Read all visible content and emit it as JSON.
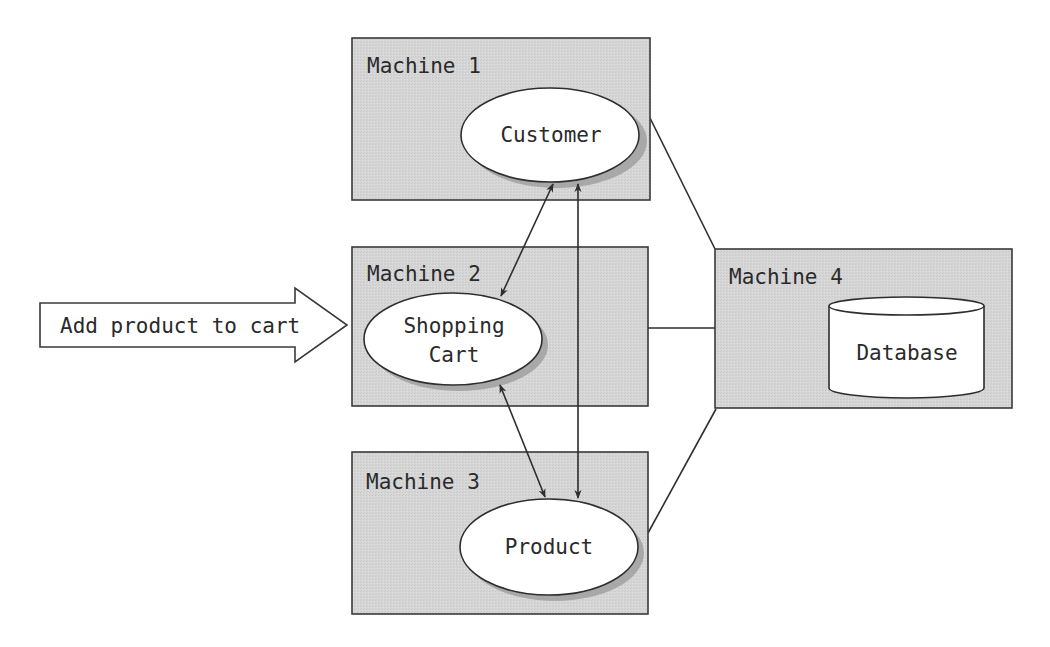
{
  "diagram": {
    "input_arrow": {
      "label": "Add product to cart"
    },
    "machines": [
      {
        "id": "m1",
        "label": "Machine 1",
        "component": {
          "type": "ellipse",
          "lines": [
            "Customer"
          ]
        }
      },
      {
        "id": "m2",
        "label": "Machine 2",
        "component": {
          "type": "ellipse",
          "lines": [
            "Shopping",
            "Cart"
          ]
        }
      },
      {
        "id": "m3",
        "label": "Machine 3",
        "component": {
          "type": "ellipse",
          "lines": [
            "Product"
          ]
        }
      },
      {
        "id": "m4",
        "label": "Machine 4",
        "component": {
          "type": "cylinder",
          "lines": [
            "Database"
          ]
        }
      }
    ],
    "connections": [
      {
        "from": "Shopping Cart",
        "to": "Customer",
        "style": "bidirectional-arrow"
      },
      {
        "from": "Shopping Cart",
        "to": "Product",
        "style": "bidirectional-arrow"
      },
      {
        "from": "Customer",
        "to": "Product",
        "style": "bidirectional-arrow"
      },
      {
        "from": "Machine 1",
        "to": "Machine 4",
        "style": "line"
      },
      {
        "from": "Machine 2",
        "to": "Machine 4",
        "style": "line"
      },
      {
        "from": "Machine 3",
        "to": "Machine 4",
        "style": "line"
      }
    ],
    "colors": {
      "machine_fill": "#d4d4d4",
      "machine_stroke": "#3a3a3a",
      "shape_fill": "#ffffff",
      "shadow": "#a8a8a8",
      "line": "#2e2e2e"
    }
  }
}
